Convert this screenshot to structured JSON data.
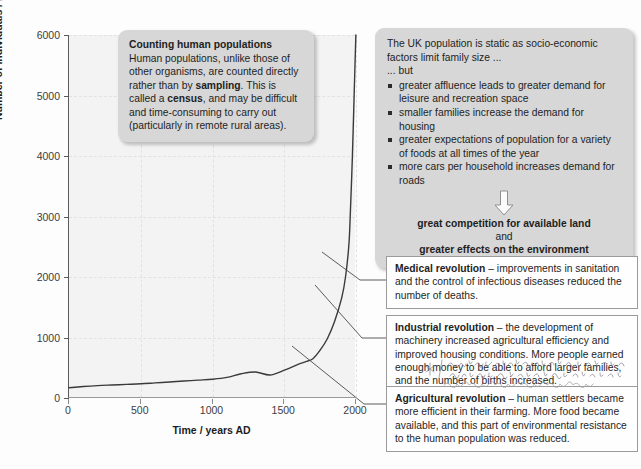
{
  "chart_data": {
    "type": "line",
    "title": "",
    "xlabel": "Time / years AD",
    "ylabel": "Number of individuals / millions",
    "xlim": [
      0,
      2000
    ],
    "ylim": [
      0,
      6000
    ],
    "xticks": [
      0,
      500,
      1000,
      1500,
      2000
    ],
    "yticks": [
      0,
      1000,
      2000,
      3000,
      4000,
      5000,
      6000
    ],
    "xtick_labels": [
      "0",
      "500",
      "1000",
      "1500",
      "2000"
    ],
    "ytick_labels": [
      "0",
      "1000",
      "2000",
      "3000",
      "4000",
      "5000",
      "6000"
    ],
    "grid": true,
    "legend": "none",
    "series": [
      {
        "name": "World human population",
        "x": [
          0,
          100,
          200,
          300,
          400,
          500,
          600,
          700,
          800,
          900,
          1000,
          1100,
          1200,
          1300,
          1400,
          1500,
          1600,
          1650,
          1700,
          1750,
          1800,
          1850,
          1900,
          1927,
          1950,
          1960,
          1975,
          1987,
          1999
        ],
        "values": [
          170,
          190,
          205,
          215,
          225,
          235,
          250,
          265,
          280,
          295,
          310,
          340,
          400,
          430,
          380,
          460,
          560,
          600,
          650,
          790,
          980,
          1260,
          1650,
          2000,
          2520,
          3020,
          4000,
          5000,
          6000
        ]
      }
    ]
  },
  "axis": {
    "ylabel": "Number of individuals / millions",
    "xlabel": "Time / years AD"
  },
  "callout_census": {
    "title": "Counting human populations",
    "body_1": "Human populations, unlike those of other organisms, are counted directly rather than by ",
    "bold_1": "sampling",
    "body_2": ". This is called a ",
    "bold_2": "census",
    "body_3": ", and may be difficult and time-consuming to carry out (particularly in remote rural areas)."
  },
  "callout_uk": {
    "lead_1": "The UK population is static as socio-economic factors limit family size ...",
    "lead_2": "... but",
    "bullets": [
      "greater affluence leads to greater demand for leisure and recreation space",
      "smaller families increase the demand for housing",
      "greater expectations of population for a variety of foods at all times of the year",
      "more cars per household increases demand for roads"
    ],
    "arrow_icon": "down-arrow-icon",
    "conclusion_1": "great competition for available land",
    "conclusion_join": "and",
    "conclusion_2": "greater effects on the environment"
  },
  "box_medical": {
    "title": "Medical revolution",
    "text": " – improvements in sanitation and the control of infectious diseases reduced the number of deaths."
  },
  "box_industrial": {
    "title": "Industrial revolution",
    "text": " – the development of machinery increased agricultural efficiency and improved housing conditions. More people earned enough money to be able to afford larger families, and the number of births increased."
  },
  "box_agricultural": {
    "title": "Agricultural revolution",
    "text": " – human settlers became more efficient in their farming. More food became available, and this part of environmental resistance to the human population was reduced."
  },
  "annotation": {
    "type": "handwriting-overlay",
    "legible_text": ""
  },
  "colors": {
    "plot_background": "#f3f3f3",
    "callout_gray": "#d7d7d7",
    "box_white": "#fefefe",
    "box_border": "#9b9b9b",
    "curve": "#3a3a3a",
    "text": "#1e1e1e",
    "gridline": "#e2e2e2"
  }
}
